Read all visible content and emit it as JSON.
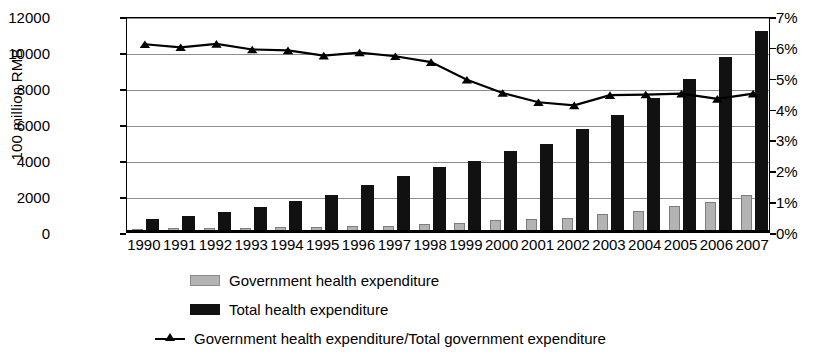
{
  "chart_data": {
    "type": "bar",
    "title": "",
    "xlabel": "",
    "ylabel": "100 million RMB",
    "y2label": "",
    "ylim": [
      0,
      12000
    ],
    "y2lim": [
      0,
      7
    ],
    "ytick_step": 2000,
    "y2tick_step": 1,
    "grid": true,
    "legend_position": "bottom",
    "categories": [
      "1990",
      "1991",
      "1992",
      "1993",
      "1994",
      "1995",
      "1996",
      "1997",
      "1998",
      "1999",
      "2000",
      "2001",
      "2002",
      "2003",
      "2004",
      "2005",
      "2006",
      "2007"
    ],
    "yticks": [
      "0",
      "2000",
      "4000",
      "6000",
      "8000",
      "10000",
      "12000"
    ],
    "y2ticks": [
      "0%",
      "1%",
      "2%",
      "3%",
      "4%",
      "5%",
      "6%",
      "7%"
    ],
    "series": [
      {
        "name": "Government health expenditure",
        "type": "bar",
        "axis": "left",
        "color": "#b3b3b3",
        "values": [
          190,
          200,
          210,
          240,
          270,
          290,
          320,
          360,
          420,
          480,
          650,
          700,
          800,
          1000,
          1150,
          1450,
          1650,
          2080
        ]
      },
      {
        "name": "Total health expenditure",
        "type": "bar",
        "axis": "left",
        "color": "#111111",
        "values": [
          750,
          900,
          1100,
          1380,
          1750,
          2080,
          2630,
          3130,
          3600,
          3950,
          4500,
          4900,
          5700,
          6500,
          7450,
          8500,
          9700,
          11150
        ]
      },
      {
        "name": "Government health expenditure/Total government expenditure",
        "type": "line",
        "axis": "right",
        "color": "#000000",
        "marker": "triangle",
        "values": [
          6.15,
          6.05,
          6.16,
          5.98,
          5.95,
          5.78,
          5.88,
          5.76,
          5.57,
          5.0,
          4.57,
          4.27,
          4.17,
          4.5,
          4.52,
          4.55,
          4.38,
          4.55
        ]
      }
    ]
  },
  "axes": {
    "left_title": "100 million RMB"
  },
  "legend": {
    "items": [
      {
        "label": "Government health expenditure",
        "marker": "gov-swatch"
      },
      {
        "label": "Total health expenditure",
        "marker": "total-swatch"
      },
      {
        "label": "Government health expenditure/Total government expenditure",
        "marker": "line-triangle-marker"
      }
    ]
  }
}
